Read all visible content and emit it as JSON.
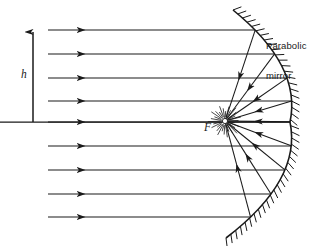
{
  "figure": {
    "type": "optics-ray-diagram",
    "background_color": "#ffffff",
    "stroke_color": "#1a1a1a",
    "width": 322,
    "height": 246
  },
  "labels": {
    "mirror_line1": "Parabolic",
    "mirror_line2": "mirror",
    "focal_point": "F",
    "height": "h"
  },
  "diagram_data": {
    "axis": {
      "name": "optical-axis",
      "y": 122,
      "x_start": 0,
      "x_end": 290
    },
    "height_arrow": {
      "name": "aperture-height-arrow",
      "x": 33,
      "y_base": 122,
      "y_tip": 28,
      "double_headed": false
    },
    "focus": {
      "x": 225,
      "y": 121,
      "marker": "open-dot"
    },
    "mirror": {
      "shape": "parabola",
      "vertex_x": 290,
      "vertex_y": 122,
      "top_end": {
        "x": 233,
        "y": 10
      },
      "bottom_end": {
        "x": 226,
        "y": 238
      },
      "hatch_side": "convex-outer",
      "hatch_count": 44,
      "hatch_length": 9
    },
    "incoming_rays": {
      "count": 9,
      "direction": "left-to-right",
      "x_start": 48,
      "arrowhead_x": 85,
      "y_values": [
        30,
        54,
        78,
        101,
        122,
        146,
        170,
        194,
        217
      ]
    },
    "reflected_rays": {
      "count": 9,
      "direction": "mirror-to-focus",
      "converge_at": "F"
    },
    "focus_burst": {
      "description": "dense short radial strokes around focal point",
      "count": 30,
      "radius": 16
    }
  }
}
